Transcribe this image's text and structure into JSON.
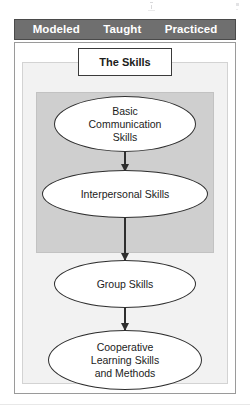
{
  "page": {
    "kind": "flow-diagram",
    "title": "The Skills"
  },
  "header": {
    "labels": [
      {
        "text": "Modeled"
      },
      {
        "text": "Taught"
      },
      {
        "text": "Practiced"
      }
    ],
    "background_color": "#6f6f6f",
    "text_color": "#ffffff"
  },
  "diagram": {
    "title_box": {
      "label": "The Skills"
    },
    "nodes": [
      {
        "id": "basic-communication-skills",
        "label": "Basic\nCommunication\nSkills",
        "shape": "ellipse",
        "inside_highlight_panel": true
      },
      {
        "id": "interpersonal-skills",
        "label": "Interpersonal Skills",
        "shape": "ellipse",
        "inside_highlight_panel": true
      },
      {
        "id": "group-skills",
        "label": "Group Skills",
        "shape": "ellipse",
        "inside_highlight_panel": false
      },
      {
        "id": "cooperative-learning-skills-and-methods",
        "label": "Cooperative\nLearning Skills\nand Methods",
        "shape": "ellipse",
        "inside_highlight_panel": false
      }
    ],
    "arrows": [
      {
        "from": "basic-communication-skills",
        "to": "interpersonal-skills",
        "direction": "down"
      },
      {
        "from": "interpersonal-skills",
        "to": "group-skills",
        "direction": "down"
      },
      {
        "from": "group-skills",
        "to": "cooperative-learning-skills-and-methods",
        "direction": "down"
      }
    ],
    "colors": {
      "node_fill": "#ffffff",
      "node_border": "#2e2e2e",
      "highlight_panel": "#cfcfcf",
      "mid_frame": "#f2f2f2",
      "outer_frame": "#ffffff",
      "text": "#1c1c1c"
    }
  }
}
